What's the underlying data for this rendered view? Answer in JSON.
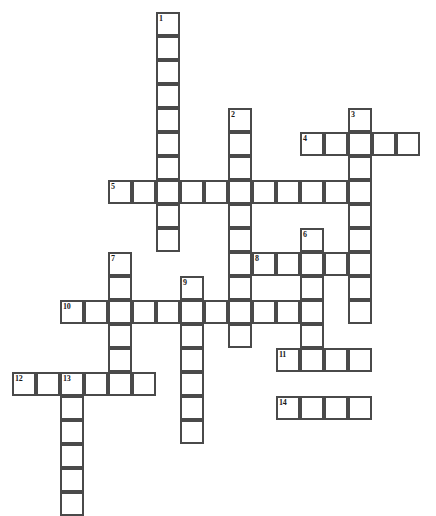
{
  "puzzle": {
    "title": "Crossword Grid",
    "cell_size": 24,
    "origin_x": 12,
    "origin_y": 12,
    "cols": 18,
    "rows": 19,
    "grid_color": "#4a4a4a",
    "cell_fill": "#ffffff",
    "background": "#ffffff",
    "number_color": "#1a1a1a"
  },
  "entries": {
    "across": [
      {
        "number": "4",
        "col": 12,
        "row": 5,
        "length": 5
      },
      {
        "number": "5",
        "col": 4,
        "row": 7,
        "length": 10
      },
      {
        "number": "8",
        "col": 10,
        "row": 10,
        "length": 4
      },
      {
        "number": "10",
        "col": 2,
        "row": 12,
        "length": 10
      },
      {
        "number": "11",
        "col": 11,
        "row": 14,
        "length": 4
      },
      {
        "number": "12",
        "col": 0,
        "row": 15,
        "length": 6
      },
      {
        "number": "14",
        "col": 11,
        "row": 16,
        "length": 4
      }
    ],
    "down": [
      {
        "number": "1",
        "col": 6,
        "row": 0,
        "length": 10
      },
      {
        "number": "2",
        "col": 9,
        "row": 4,
        "length": 10
      },
      {
        "number": "3",
        "col": 14,
        "row": 4,
        "length": 9
      },
      {
        "number": "6",
        "col": 12,
        "row": 9,
        "length": 6
      },
      {
        "number": "7",
        "col": 4,
        "row": 10,
        "length": 6
      },
      {
        "number": "9",
        "col": 7,
        "row": 11,
        "length": 7
      },
      {
        "number": "13",
        "col": 2,
        "row": 15,
        "length": 6
      }
    ]
  },
  "labels": {
    "n1": "1",
    "n2": "2",
    "n3": "3",
    "n4": "4",
    "n5": "5",
    "n6": "6",
    "n7": "7",
    "n8": "8",
    "n9": "9",
    "n10": "10",
    "n11": "11",
    "n12": "12",
    "n13": "13",
    "n14": "14"
  }
}
